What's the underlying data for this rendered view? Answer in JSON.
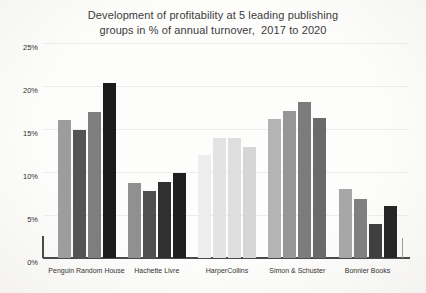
{
  "chart_data": {
    "type": "bar",
    "title": "Development of profitability at 5 leading publishing groups in % of annual turnover,  2017 to 2020",
    "title_line1": "Development of profitability at 5 leading publishing",
    "title_line2": "groups in % of annual turnover,  2017 to 2020",
    "categories": [
      "Penguin Random House",
      "Hachette Livre",
      "HarperCollins",
      "Simon & Schuster",
      "Bonnier Books"
    ],
    "series": [
      {
        "name": "2017",
        "values": [
          16.0,
          8.7,
          12.0,
          16.2,
          8.0
        ]
      },
      {
        "name": "2018",
        "values": [
          14.9,
          7.8,
          14.0,
          17.1,
          6.9
        ]
      },
      {
        "name": "2019",
        "values": [
          17.0,
          8.8,
          14.0,
          18.1,
          4.0
        ]
      },
      {
        "name": "2020",
        "values": [
          20.3,
          9.9,
          12.9,
          16.3,
          6.0
        ]
      }
    ],
    "xlabel": "",
    "ylabel": "",
    "ylim": [
      0,
      25
    ],
    "yticks": [
      "25%",
      "20%",
      "15%",
      "10%",
      "5%",
      "0%"
    ],
    "grid": true,
    "legend": "none",
    "bar_colors": [
      [
        "#9d9d9d",
        "#545454",
        "#7e7e7e",
        "#1b1b1b"
      ],
      [
        "#909090",
        "#505050",
        "#303030",
        "#1f1f1f"
      ],
      [
        "#ededed",
        "#e3e3e3",
        "#dedede",
        "#d6d6d6"
      ],
      [
        "#b4b4b4",
        "#969696",
        "#7c7c7c",
        "#6a6a6a"
      ],
      [
        "#a7a7a7",
        "#7f7f7f",
        "#3f3f3f",
        "#262626"
      ]
    ],
    "colors": {
      "background": "#fbfafa",
      "axis": "#4a4a4a",
      "gridline": "#ececec",
      "title_text": "#3b3b3b",
      "tick_text": "#2f2f2f"
    }
  }
}
